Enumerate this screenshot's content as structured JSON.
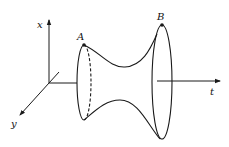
{
  "diagram": {
    "type": "3D surface of revolution (hyperboloid-like) between two points",
    "stroke_color": "#1a1a1a",
    "background": "#ffffff",
    "axes": {
      "x_label": "x",
      "y_label": "y",
      "t_label": "t"
    },
    "points": {
      "A_label": "A",
      "B_label": "B"
    }
  }
}
